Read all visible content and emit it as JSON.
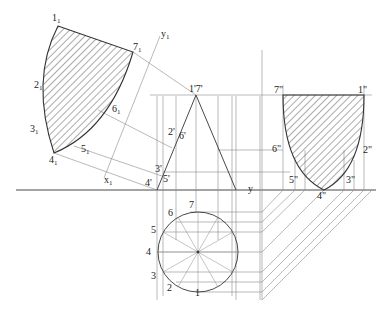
{
  "diagram": {
    "type": "orthographic-projection-cone-section",
    "axes": {
      "x1": "x1",
      "y1": "y1",
      "y": "y"
    },
    "auxiliary_view_labels": [
      "11",
      "21",
      "31",
      "41",
      "51",
      "61",
      "71"
    ],
    "front_view_labels": [
      "1'7'",
      "2'",
      "6'",
      "3'",
      "5'",
      "4'"
    ],
    "side_view_labels": [
      "7\"",
      "1\"",
      "6\"",
      "2\"",
      "5\"",
      "3\"",
      "4\""
    ],
    "top_view_labels": [
      "1",
      "2",
      "3",
      "4",
      "5",
      "6",
      "7"
    ],
    "colors": {
      "line": "#333333",
      "hatch": "#444444",
      "construction": "#8a8a8a",
      "background": "#ffffff"
    }
  },
  "labels": {
    "a1": "1",
    "a2": "2",
    "a3": "3",
    "a4": "4",
    "a5": "5",
    "a6": "6",
    "a7": "7",
    "sub": "1",
    "y1": "y",
    "x1": "x",
    "y": "y",
    "f17": "1'7'",
    "f2": "2'",
    "f6": "6'",
    "f3": "3'",
    "f5": "5'",
    "f4": "4'",
    "s7": "7\"",
    "s1": "1\"",
    "s6": "6\"",
    "s2": "2\"",
    "s5": "5\"",
    "s3": "3\"",
    "s4": "4\"",
    "t1": "1",
    "t2": "2",
    "t3": "3",
    "t4": "4",
    "t5": "5",
    "t6": "6",
    "t7": "7"
  }
}
